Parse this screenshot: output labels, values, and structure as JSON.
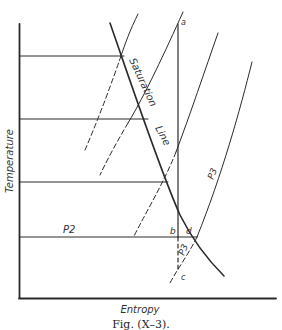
{
  "figure": {
    "caption": "Fig. (X–3).",
    "x_axis_label": "Entropy",
    "y_axis_label": "Temperature",
    "curve_labels": {
      "saturation_1": "Saturation",
      "saturation_2": "Line",
      "p2": "P2",
      "p3_upper": "P3",
      "p3_lower": "P3"
    },
    "point_labels": {
      "a": "a",
      "b": "b",
      "c": "c",
      "d": "d"
    },
    "colors": {
      "line": "#222222",
      "background": "#ffffff"
    }
  }
}
